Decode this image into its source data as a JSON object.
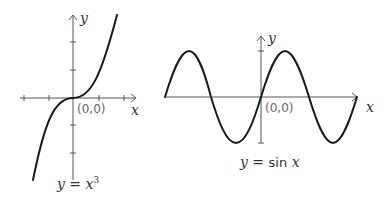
{
  "graphs": [
    {
      "id": "cubic",
      "function": "y = x^3",
      "caption_y": "y",
      "caption_eq": " = ",
      "caption_x": "x",
      "caption_exp": "3",
      "x_axis_label": "x",
      "y_axis_label": "y",
      "origin_label": "(0,0)"
    },
    {
      "id": "sine",
      "function": "y = sin x",
      "caption_y": "y",
      "caption_eq": " = ",
      "caption_fn": "sin",
      "caption_x": "x",
      "x_axis_label": "x",
      "y_axis_label": "y",
      "origin_label": "(0,0)"
    }
  ],
  "colors": {
    "curve": "#1a1a1a",
    "axis": "#555555",
    "text": "#333333"
  }
}
